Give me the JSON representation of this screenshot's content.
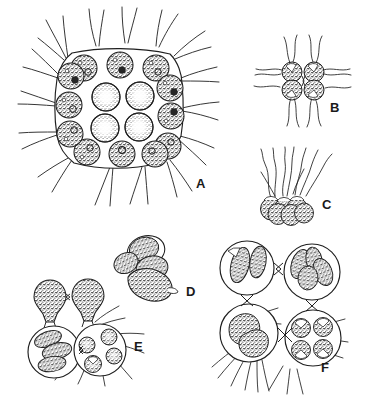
{
  "figure": {
    "style": "ink line drawing with stipple shading",
    "background_color": "#ffffff",
    "ink_color": "#1a1a1a",
    "panel_count": 6
  },
  "panels": [
    {
      "id": "A",
      "label": "A",
      "label_x": 196,
      "label_y": 188,
      "caption": "Mature 16-celled flat colony in face view",
      "cell_count": 16,
      "arrangement": "4 x 4 grid within a rounded square gelatinous envelope",
      "peripheral_cells": 12,
      "central_cells": 4,
      "flagella_visible": true,
      "envelope_shape": "rounded-square"
    },
    {
      "id": "B",
      "label": "B",
      "label_x": 330,
      "label_y": 112,
      "caption": "Four-celled colony in face view with flagella",
      "cell_count": 4,
      "arrangement": "2 x 2 rhomboid cluster",
      "flagella_visible": true,
      "envelope_shape": "none-visible"
    },
    {
      "id": "C",
      "label": "C",
      "label_x": 322,
      "label_y": 209,
      "caption": "Colony in lateral view showing flagella directed to one side",
      "cell_count": 6,
      "arrangement": "single row seen edgewise",
      "flagella_visible": true,
      "envelope_shape": "none-visible"
    },
    {
      "id": "D",
      "label": "D",
      "label_x": 186,
      "label_y": 296,
      "caption": "Cells undergoing cleavage, flagella absent",
      "cell_count": 4,
      "arrangement": "loose cleaving mass",
      "flagella_visible": false,
      "envelope_shape": "none-visible"
    },
    {
      "id": "E",
      "label": "E",
      "label_x": 134,
      "label_y": 351,
      "caption": "Colony cells with daughter colonies forming within",
      "cell_count": 4,
      "arrangement": "two upper cells and two enlarged lower mother cells",
      "flagella_visible": true,
      "envelope_shape": "circular mother-cell walls"
    },
    {
      "id": "F",
      "label": "F",
      "label_x": 321,
      "label_y": 372,
      "caption": "Four mother cells with daughter colonies at successive stages",
      "cell_count": 4,
      "arrangement": "2 x 2 of enlarged circular mother cells joined by bowtie junctions",
      "flagella_visible": true,
      "envelope_shape": "circular mother-cell walls"
    }
  ]
}
